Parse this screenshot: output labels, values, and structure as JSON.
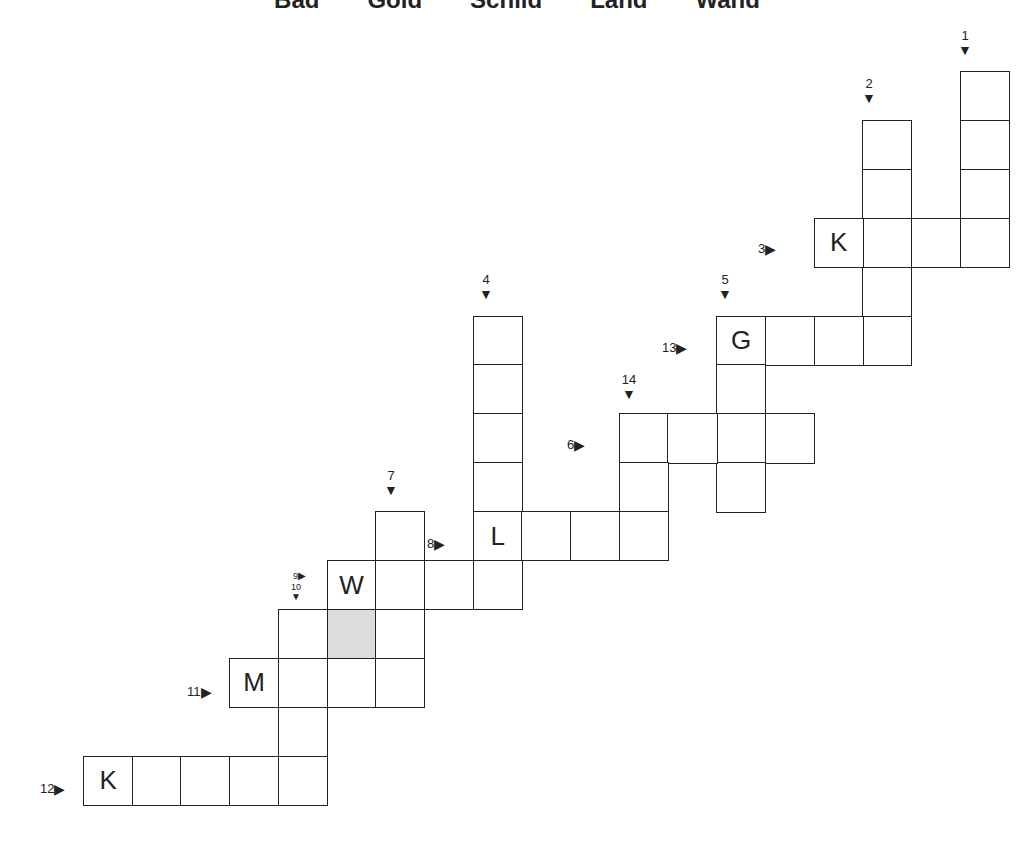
{
  "word_bank": [
    "Bad",
    "Gold",
    "Schild",
    "Land",
    "Wand"
  ],
  "grid": {
    "origin_x": 83,
    "origin_y": 71,
    "cell_w": 48.7,
    "cell_h": 48.9,
    "cells": [
      {
        "r": 0,
        "c": 18
      },
      {
        "r": 1,
        "c": 18
      },
      {
        "r": 2,
        "c": 18
      },
      {
        "r": 3,
        "c": 18
      },
      {
        "r": 1,
        "c": 16
      },
      {
        "r": 2,
        "c": 16
      },
      {
        "r": 3,
        "c": 16
      },
      {
        "r": 4,
        "c": 16
      },
      {
        "r": 5,
        "c": 16
      },
      {
        "r": 3,
        "c": 15,
        "letter": "K"
      },
      {
        "r": 3,
        "c": 17
      },
      {
        "r": 5,
        "c": 13,
        "letter": "G"
      },
      {
        "r": 5,
        "c": 14
      },
      {
        "r": 5,
        "c": 15
      },
      {
        "r": 6,
        "c": 13
      },
      {
        "r": 7,
        "c": 13
      },
      {
        "r": 8,
        "c": 13
      },
      {
        "r": 7,
        "c": 11
      },
      {
        "r": 7,
        "c": 12
      },
      {
        "r": 7,
        "c": 14
      },
      {
        "r": 8,
        "c": 11
      },
      {
        "r": 5,
        "c": 8
      },
      {
        "r": 6,
        "c": 8
      },
      {
        "r": 7,
        "c": 8
      },
      {
        "r": 8,
        "c": 8
      },
      {
        "r": 9,
        "c": 8,
        "letter": "L"
      },
      {
        "r": 9,
        "c": 9
      },
      {
        "r": 9,
        "c": 10
      },
      {
        "r": 9,
        "c": 11
      },
      {
        "r": 10,
        "c": 8
      },
      {
        "r": 9,
        "c": 6
      },
      {
        "r": 10,
        "c": 5,
        "letter": "W"
      },
      {
        "r": 10,
        "c": 6
      },
      {
        "r": 10,
        "c": 7
      },
      {
        "r": 11,
        "c": 4
      },
      {
        "r": 11,
        "c": 5,
        "shaded": true
      },
      {
        "r": 11,
        "c": 6
      },
      {
        "r": 12,
        "c": 3,
        "letter": "M"
      },
      {
        "r": 12,
        "c": 4
      },
      {
        "r": 12,
        "c": 5
      },
      {
        "r": 12,
        "c": 6
      },
      {
        "r": 13,
        "c": 4
      },
      {
        "r": 14,
        "c": 0,
        "letter": "K"
      },
      {
        "r": 14,
        "c": 1
      },
      {
        "r": 14,
        "c": 2
      },
      {
        "r": 14,
        "c": 3
      },
      {
        "r": 14,
        "c": 4
      }
    ]
  },
  "clues": [
    {
      "num": "1",
      "dir": "down",
      "x": 965,
      "y": 28
    },
    {
      "num": "2",
      "dir": "down",
      "x": 869,
      "y": 76
    },
    {
      "num": "3",
      "dir": "across",
      "x": 758,
      "y": 241
    },
    {
      "num": "4",
      "dir": "down",
      "x": 486,
      "y": 272
    },
    {
      "num": "5",
      "dir": "down",
      "x": 725,
      "y": 272
    },
    {
      "num": "13",
      "dir": "across",
      "x": 662,
      "y": 340
    },
    {
      "num": "14",
      "dir": "down",
      "x": 629,
      "y": 372
    },
    {
      "num": "6",
      "dir": "across",
      "x": 567,
      "y": 437
    },
    {
      "num": "7",
      "dir": "down",
      "x": 391,
      "y": 468
    },
    {
      "num": "8",
      "dir": "across",
      "x": 427,
      "y": 536
    },
    {
      "num": "9",
      "dir": "across",
      "x": 293,
      "y": 571,
      "small": true
    },
    {
      "num": "10",
      "dir": "down",
      "x": 296,
      "y": 582,
      "small": true
    },
    {
      "num": "11",
      "dir": "across",
      "x": 187,
      "y": 684
    },
    {
      "num": "12",
      "dir": "across",
      "x": 40,
      "y": 781
    }
  ]
}
